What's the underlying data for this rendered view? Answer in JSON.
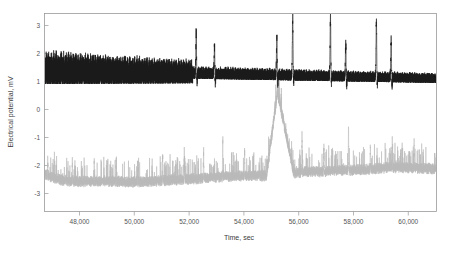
{
  "chart_data": {
    "type": "line",
    "title": "",
    "xlabel": "Time, sec",
    "ylabel": "Electrical potential, mV",
    "xlim": [
      46900,
      61200
    ],
    "ylim": [
      -3.55,
      3.45
    ],
    "xticks": [
      48000,
      50000,
      52000,
      54000,
      56000,
      58000,
      60000
    ],
    "xticklabels": [
      "48,000",
      "50,000",
      "52,000",
      "54,000",
      "56,000",
      "58,000",
      "60,000"
    ],
    "yticks": [
      3,
      2,
      1,
      0,
      -1,
      -2,
      -3
    ],
    "yticklabels": [
      "3",
      "2",
      "1",
      "0",
      "-1",
      "-2",
      "-3"
    ],
    "grid": false,
    "legend_position": "none",
    "series": [
      {
        "name": "upper-channel",
        "color": "#1a1a1a",
        "style": "solid",
        "baseline": 1.35,
        "description": "Dense high-frequency oscillation riding on a ~1.3 mV baseline, amplitude ~0.5-0.9 mV early, damping toward the right, punctuated by tall isolated spikes up to ~3.3 mV after 52,400 sec",
        "spike_times": [
          52430,
          53100,
          55380,
          55960,
          57340,
          57900,
          59020,
          59560
        ],
        "spike_peaks": [
          2.75,
          2.3,
          2.6,
          3.3,
          3.35,
          2.35,
          3.2,
          2.6
        ],
        "x": [
          46900,
          47500,
          48000,
          48500,
          49000,
          49500,
          50000,
          50500,
          51000,
          51500,
          52000,
          52430,
          53100,
          53500,
          54000,
          54500,
          55000,
          55380,
          55960,
          56500,
          57000,
          57340,
          57900,
          58400,
          59020,
          59560,
          60000,
          60500,
          61200
        ],
        "y": [
          1.75,
          1.8,
          1.72,
          1.7,
          1.68,
          1.65,
          1.62,
          1.6,
          1.58,
          1.5,
          1.45,
          2.75,
          2.3,
          1.3,
          1.25,
          1.22,
          1.2,
          2.6,
          3.3,
          1.18,
          1.15,
          3.35,
          2.35,
          1.12,
          3.2,
          2.6,
          1.18,
          1.2,
          1.15
        ]
      },
      {
        "name": "lower-channel",
        "color": "#b9b9b9",
        "style": "dotted-noisy",
        "baseline": -2.45,
        "description": "Noisy light-gray trace centred near -2.4 mV, rising slightly to -2.0 mV on the right, with narrow upward spikes; one very tall spike near 55,400 sec extends off the top of the band",
        "spike_times": [
          47000,
          47900,
          48700,
          49500,
          50300,
          51200,
          52000,
          52700,
          53400,
          54200,
          55400,
          56300,
          57100,
          58000,
          58800,
          59600,
          60400
        ],
        "spike_peaks": [
          -1.75,
          -1.8,
          -1.75,
          -1.7,
          -1.8,
          -1.65,
          -1.6,
          -1.4,
          -1.1,
          -1.45,
          0.7,
          -0.85,
          -1.3,
          -0.6,
          -1.2,
          -1.1,
          -1.0
        ],
        "x": [
          46900,
          47500,
          48000,
          48500,
          49000,
          49500,
          50000,
          50500,
          51000,
          51500,
          52000,
          52500,
          53000,
          53500,
          54000,
          54500,
          55000,
          55400,
          56000,
          56500,
          57000,
          57500,
          58000,
          58500,
          59000,
          59500,
          60000,
          60500,
          61200
        ],
        "y": [
          -2.25,
          -2.45,
          -2.5,
          -2.5,
          -2.48,
          -2.5,
          -2.52,
          -2.5,
          -2.48,
          -2.45,
          -2.42,
          -2.4,
          -2.35,
          -2.32,
          -2.3,
          -2.28,
          -2.3,
          0.7,
          -2.2,
          -2.15,
          -2.15,
          -2.1,
          -2.1,
          -2.08,
          -2.05,
          -2.0,
          -2.0,
          -2.02,
          -2.05
        ]
      }
    ]
  },
  "axes": {
    "xlabel": "Time, sec",
    "ylabel": "Electrical potential, mV"
  }
}
